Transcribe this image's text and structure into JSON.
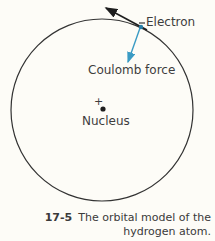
{
  "labels": {
    "electron": "Electron",
    "coulomb_force": "Coulomb force",
    "nucleus": "Nucleus",
    "nucleus_charge": "+"
  },
  "caption": {
    "number": "17-5",
    "line1": "The orbital model of the",
    "line2": "hydrogen atom."
  },
  "colors": {
    "background": "#fdfcf7",
    "orbit": "#333333",
    "velocity_arrow": "#1e1e1e",
    "force_arrow": "#3a9bc4",
    "text": "#3d3d3d"
  }
}
